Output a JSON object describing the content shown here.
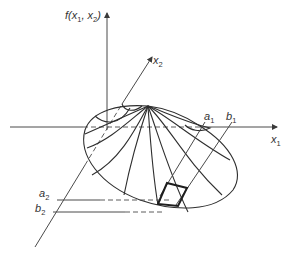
{
  "figure": {
    "type": "bivariate probability density surface",
    "axes": {
      "vertical": {
        "label_main": "f(x",
        "sub1": "1",
        "mid": ", x",
        "sub2": "2",
        "end": ")"
      },
      "x1": {
        "label": "x",
        "sub": "1"
      },
      "x2": {
        "label": "x",
        "sub": "2"
      }
    },
    "bounds": {
      "a1": {
        "label": "a",
        "sub": "1"
      },
      "b1": {
        "label": "b",
        "sub": "1"
      },
      "a2": {
        "label": "a",
        "sub": "2"
      },
      "b2": {
        "label": "b",
        "sub": "2"
      }
    },
    "colors": {
      "line": "#2e2e2e",
      "background": "#ffffff"
    }
  }
}
